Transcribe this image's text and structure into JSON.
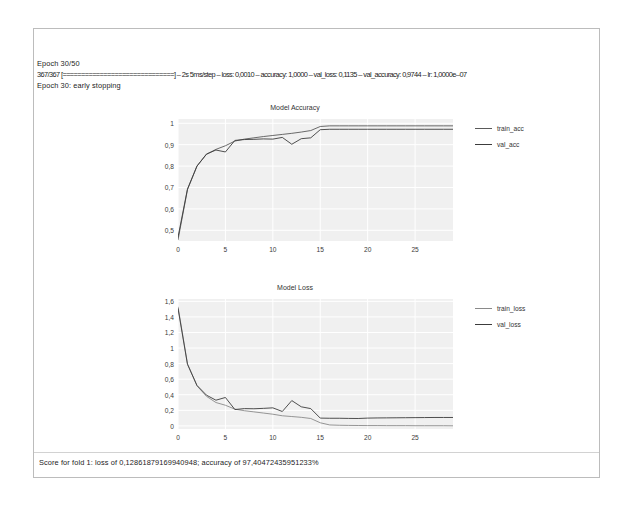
{
  "notebook": {
    "execution_count": "1",
    "log_lines": [
      "Epoch 30/50",
      "367/367 [==============================] – 2s 5ms/step – loss: 0,0010 – accuracy: 1,0000 – val_loss: 0,1135 – val_accuracy: 0,9744 – lr: 1,0000e–07",
      "Epoch 30: early stopping"
    ],
    "score_line": "Score for fold 1: loss of 0,12861879169940948; accuracy of 97,40472435951233%"
  },
  "colors": {
    "plot_background": "#f0f0f0",
    "grid": "#ffffff",
    "train_line": "#5a5a5a",
    "val_line": "#3c3c3c",
    "frame_border": "#bcbcbc",
    "badge": "#c9c9c9"
  },
  "chart_data": [
    {
      "type": "line",
      "title": "Model Accuracy",
      "xlabel": "",
      "ylabel": "",
      "xlim": [
        0,
        29
      ],
      "ylim": [
        0.45,
        1.02
      ],
      "grid": true,
      "legend_position": "right",
      "xticks": [
        "0",
        "5",
        "10",
        "15",
        "20",
        "25"
      ],
      "xtick_values": [
        0,
        5,
        10,
        15,
        20,
        25
      ],
      "yticks": [
        "0,5",
        "0,6",
        "0,7",
        "0,8",
        "0,9",
        "1"
      ],
      "ytick_values": [
        0.5,
        0.6,
        0.7,
        0.8,
        0.9,
        1.0
      ],
      "x": [
        0,
        1,
        2,
        3,
        4,
        5,
        6,
        7,
        8,
        9,
        10,
        11,
        12,
        13,
        14,
        15,
        16,
        17,
        18,
        19,
        20,
        21,
        22,
        23,
        24,
        25,
        26,
        27,
        28,
        29
      ],
      "series": [
        {
          "name": "train_acc",
          "color": "#5a5a5a",
          "values": [
            0.455,
            0.69,
            0.8,
            0.855,
            0.878,
            0.895,
            0.917,
            0.926,
            0.932,
            0.938,
            0.943,
            0.948,
            0.953,
            0.959,
            0.966,
            0.985,
            0.988,
            0.988,
            0.988,
            0.988,
            0.988,
            0.988,
            0.988,
            0.988,
            0.988,
            0.988,
            0.988,
            0.988,
            0.988,
            0.988
          ]
        },
        {
          "name": "val_acc",
          "color": "#3c3c3c",
          "values": [
            0.468,
            0.693,
            0.8,
            0.856,
            0.875,
            0.866,
            0.92,
            0.924,
            0.925,
            0.927,
            0.926,
            0.934,
            0.902,
            0.928,
            0.932,
            0.97,
            0.972,
            0.972,
            0.972,
            0.972,
            0.972,
            0.972,
            0.972,
            0.972,
            0.972,
            0.972,
            0.972,
            0.972,
            0.972,
            0.972
          ]
        }
      ]
    },
    {
      "type": "line",
      "title": "Model Loss",
      "xlabel": "",
      "ylabel": "",
      "xlim": [
        0,
        29
      ],
      "ylim": [
        -0.04,
        1.63
      ],
      "grid": true,
      "legend_position": "right",
      "xticks": [
        "0",
        "5",
        "10",
        "15",
        "20",
        "25"
      ],
      "xtick_values": [
        0,
        5,
        10,
        15,
        20,
        25
      ],
      "yticks": [
        "0",
        "0,2",
        "0,4",
        "0,6",
        "0,8",
        "1",
        "1,2",
        "1,4",
        "1,6"
      ],
      "ytick_values": [
        0,
        0.2,
        0.4,
        0.6,
        0.8,
        1.0,
        1.2,
        1.4,
        1.6
      ],
      "x": [
        0,
        1,
        2,
        3,
        4,
        5,
        6,
        7,
        8,
        9,
        10,
        11,
        12,
        13,
        14,
        15,
        16,
        17,
        18,
        19,
        20,
        21,
        22,
        23,
        24,
        25,
        26,
        27,
        28,
        29
      ],
      "series": [
        {
          "name": "train_loss",
          "color": "#8a8a8a",
          "values": [
            1.53,
            0.8,
            0.515,
            0.38,
            0.3,
            0.265,
            0.215,
            0.195,
            0.18,
            0.165,
            0.15,
            0.13,
            0.12,
            0.11,
            0.095,
            0.04,
            0.012,
            0.008,
            0.006,
            0.005,
            0.004,
            0.004,
            0.003,
            0.003,
            0.003,
            0.002,
            0.002,
            0.002,
            0.002,
            0.001
          ]
        },
        {
          "name": "val_loss",
          "color": "#3c3c3c",
          "values": [
            1.51,
            0.79,
            0.52,
            0.395,
            0.33,
            0.365,
            0.21,
            0.222,
            0.22,
            0.225,
            0.232,
            0.185,
            0.325,
            0.245,
            0.222,
            0.1,
            0.098,
            0.098,
            0.096,
            0.095,
            0.1,
            0.102,
            0.103,
            0.104,
            0.105,
            0.106,
            0.107,
            0.108,
            0.108,
            0.108
          ]
        }
      ]
    }
  ]
}
